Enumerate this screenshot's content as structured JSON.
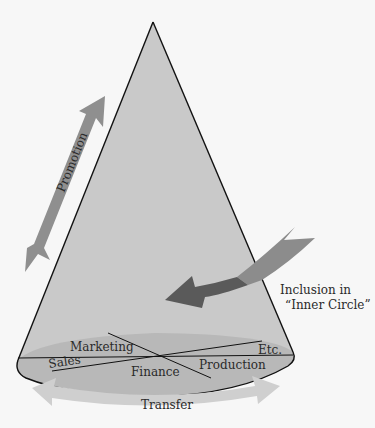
{
  "diagram": {
    "type": "organizational-cone",
    "shape": "cone",
    "arrows": {
      "promotion": {
        "label": "Promotion",
        "direction": "vertical-up"
      },
      "transfer": {
        "label": "Transfer",
        "direction": "horizontal-both"
      },
      "inclusion": {
        "label_line1": "Inclusion in",
        "label_line2": "“Inner Circle”",
        "direction": "radial-inward"
      }
    },
    "functions": [
      {
        "label": "Marketing"
      },
      {
        "label": "Sales"
      },
      {
        "label": "Finance"
      },
      {
        "label": "Production"
      },
      {
        "label": "Etc."
      }
    ]
  },
  "colors": {
    "background": "#f7f7f7",
    "cone_fill": "#c9c9c9",
    "base_fill": "#b4b4b4",
    "outline": "#111111",
    "promotion_arrow": "#8f8f8f",
    "transfer_arrow": "#cfcfcf",
    "inclusion_arrow_light": "#8c8c8c",
    "inclusion_arrow_dark": "#5a5a5a"
  }
}
